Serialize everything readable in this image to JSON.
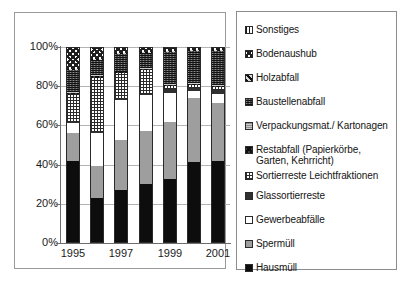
{
  "chart_data": {
    "type": "bar",
    "subtype": "stacked-100-percent",
    "title": "",
    "xlabel": "",
    "ylabel": "",
    "ylim": [
      0,
      100
    ],
    "ytick_labels": [
      "0%",
      "20%",
      "40%",
      "60%",
      "80%",
      "100%"
    ],
    "ytick_values": [
      0,
      20,
      40,
      60,
      80,
      100
    ],
    "grid": true,
    "legend_position": "right",
    "categories": [
      "1995",
      "1996",
      "1997",
      "1998",
      "1999",
      "2000",
      "2001"
    ],
    "visible_tick_labels": [
      "1995",
      "",
      "1997",
      "",
      "1999",
      "",
      "2001"
    ],
    "series": [
      {
        "name": "Hausmüll",
        "pattern": "solid-black",
        "values": [
          42.0,
          23.0,
          27.0,
          30.0,
          32.5,
          41.5,
          42.0
        ]
      },
      {
        "name": "Sperrmüll",
        "pattern": "gray",
        "values": [
          14.0,
          16.5,
          25.5,
          27.0,
          29.0,
          32.5,
          29.5
        ]
      },
      {
        "name": "Gewerbeabfälle",
        "pattern": "white",
        "values": [
          5.0,
          16.5,
          20.5,
          18.5,
          15.0,
          3.5,
          4.5
        ]
      },
      {
        "name": "Glassortierreste",
        "pattern": "dark2",
        "values": [
          0.5,
          0.5,
          0.5,
          0.5,
          2.0,
          1.5,
          2.0
        ]
      },
      {
        "name": "Sortierreste Leichtfraktionen",
        "pattern": "grid-fine",
        "values": [
          14.5,
          27.5,
          13.0,
          12.5,
          1.5,
          1.5,
          1.5
        ]
      },
      {
        "name": "Restabfall (Papierkörbe, Garten, Kehrricht)",
        "pattern": "checker-dark",
        "values": [
          0.5,
          1.0,
          0.5,
          0.5,
          0.5,
          0.5,
          0.5
        ]
      },
      {
        "name": "Verpackungsmat./ Kartonagen",
        "pattern": "gray-dots",
        "values": [
          0.5,
          0.5,
          0.5,
          0.5,
          0.5,
          0.5,
          0.5
        ]
      },
      {
        "name": "Baustellenabfall",
        "pattern": "dark-speck",
        "values": [
          11.5,
          8.0,
          9.0,
          7.5,
          16.5,
          16.5,
          17.5
        ]
      },
      {
        "name": "Holzabfall",
        "pattern": "diag-dense",
        "values": [
          0.5,
          0.5,
          0.5,
          0.5,
          0.5,
          0.5,
          0.5
        ]
      },
      {
        "name": "Bodenaushub",
        "pattern": "checker-light",
        "values": [
          11.0,
          6.0,
          3.0,
          2.5,
          2.0,
          1.5,
          1.5
        ]
      },
      {
        "name": "Sonstiges",
        "pattern": "vstripe",
        "values": [
          0.0,
          0.0,
          0.0,
          0.0,
          0.0,
          0.0,
          0.0
        ]
      }
    ],
    "legend_entries": [
      {
        "label": "Sonstiges",
        "pattern": "vstripe"
      },
      {
        "label": "Bodenaushub",
        "pattern": "checker-light"
      },
      {
        "label": "Holzabfall",
        "pattern": "diag-dense"
      },
      {
        "label": "Baustellenabfall",
        "pattern": "dark-speck"
      },
      {
        "label": "Verpackungsmat./ Kartonagen",
        "pattern": "gray-dots"
      },
      {
        "label": "Restabfall (Papierkörbe, Garten, Kehrricht)",
        "pattern": "checker-dark"
      },
      {
        "label": "Sortierreste Leichtfraktionen",
        "pattern": "grid-fine"
      },
      {
        "label": "Glassortierreste",
        "pattern": "dark2"
      },
      {
        "label": "Gewerbeabfälle",
        "pattern": "white"
      },
      {
        "label": "Spermüll",
        "pattern": "gray"
      },
      {
        "label": "Hausmüll",
        "pattern": "solid-black"
      }
    ]
  },
  "legend": {
    "items": [
      "Sonstiges",
      "Bodenaushub",
      "Holzabfall",
      "Baustellenabfall",
      "Verpackungsmat./ Kartonagen",
      "Restabfall (Papierkörbe, Garten, Kehrricht)",
      "Sortierreste Leichtfraktionen",
      "Glassortierreste",
      "Gewerbeabfälle",
      "Sperrmüll",
      "Hausmüll"
    ]
  },
  "colors": {
    "axis": "#6e6e6e",
    "grid": "#b4b4b4",
    "frame": "#9a9a9a",
    "text": "#1a1a1a",
    "black_fill": "#0d0d0d",
    "gray_fill": "#9e9e9e",
    "white_fill": "#ffffff"
  }
}
